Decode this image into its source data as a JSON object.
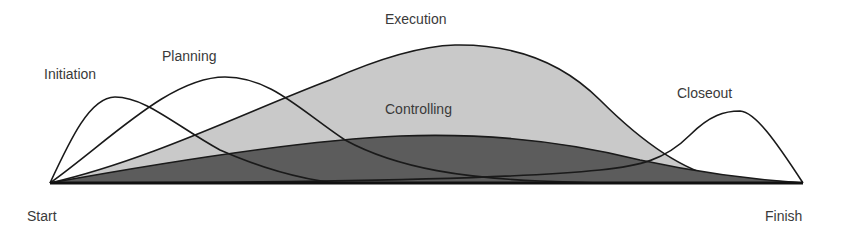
{
  "diagram": {
    "phases": [
      {
        "name": "Initiation",
        "label_x": 44,
        "label_y": 66
      },
      {
        "name": "Planning",
        "label_x": 162,
        "label_y": 48
      },
      {
        "name": "Execution",
        "label_x": 385,
        "label_y": 11
      },
      {
        "name": "Controlling",
        "label_x": 385,
        "label_y": 101
      },
      {
        "name": "Closeout",
        "label_x": 677,
        "label_y": 85
      }
    ],
    "axis": {
      "start_label": "Start",
      "finish_label": "Finish"
    },
    "colors": {
      "execution_fill": "#c9c9c9",
      "controlling_fill": "#5c5c5c",
      "line": "#1a1a1a",
      "background": "#ffffff"
    }
  }
}
